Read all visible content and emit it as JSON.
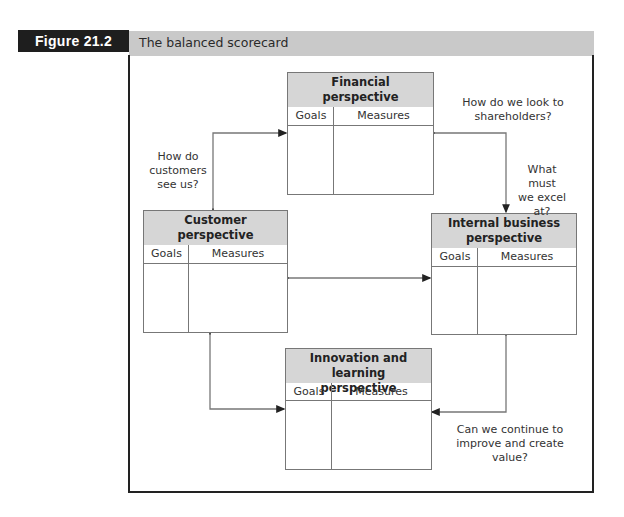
{
  "figure": {
    "label": "Figure 21.2",
    "title": "The balanced scorecard"
  },
  "boxes": {
    "financial": {
      "title_line1": "Financial",
      "title_line2": "perspective",
      "col_goals": "Goals",
      "col_measures": "Measures"
    },
    "customer": {
      "title_line1": "Customer",
      "title_line2": "perspective",
      "col_goals": "Goals",
      "col_measures": "Measures"
    },
    "internal": {
      "title_line1": "Internal business",
      "title_line2": "perspective",
      "col_goals": "Goals",
      "col_measures": "Measures"
    },
    "innovation": {
      "title_line1": "Innovation and learning",
      "title_line2": "perspective",
      "col_goals": "Goals",
      "col_measures": "Measures"
    }
  },
  "questions": {
    "shareholders_l1": "How do we look to",
    "shareholders_l2": "shareholders?",
    "customers_l1": "How do",
    "customers_l2": "customers",
    "customers_l3": "see us?",
    "excel_l1": "What must",
    "excel_l2": "we excel",
    "excel_l3": "at?",
    "improve_l1": "Can we continue to",
    "improve_l2": "improve and create value?"
  },
  "colors": {
    "label_bg": "#1e1e1e",
    "title_bar_bg": "#c9c9c9",
    "box_header_bg": "#d6d6d6",
    "line": "#777777"
  }
}
